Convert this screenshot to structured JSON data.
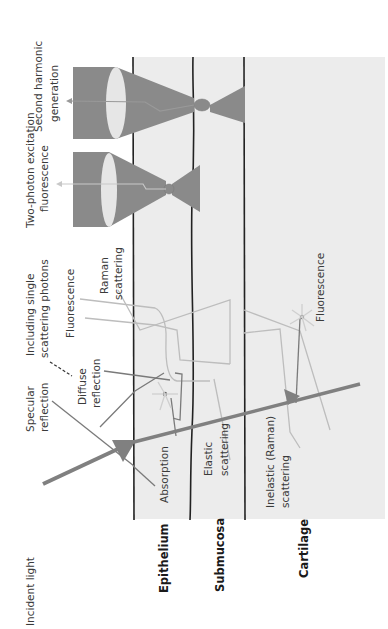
{
  "diagram": {
    "orientation": "rotated-90-ccw",
    "layers": [
      {
        "name": "Epithelium"
      },
      {
        "name": "Submucosa"
      },
      {
        "name": "Cartilage"
      }
    ],
    "labels": {
      "incident_light": "Incident light",
      "specular_reflection_1": "Specular",
      "specular_reflection_2": "reflection",
      "diffuse_reflection_1": "Diffuse",
      "diffuse_reflection_2": "reflection",
      "including_single_1": "Including single",
      "including_single_2": "scattering photons",
      "fluorescence_top": "Fluorescence",
      "raman_1": "Raman",
      "raman_2": "scattering",
      "two_photon_1": "Two-photon excitation",
      "two_photon_2": "fluorescence",
      "shg_1": "Second harmonic",
      "shg_2": "generation",
      "absorption": "Absorption",
      "elastic_1": "Elastic",
      "elastic_2": "scattering",
      "inelastic_1": "Inelastic (Raman)",
      "inelastic_2": "scattering",
      "fluorescence_deep": "Fluorescence"
    },
    "colors": {
      "tissue_bg": "#ececec",
      "boundary": "#222222",
      "beam": "#808080",
      "light_path": "#bdbdbd",
      "dark_path": "#7a7a7a",
      "lens": "#e6e6e6"
    }
  }
}
